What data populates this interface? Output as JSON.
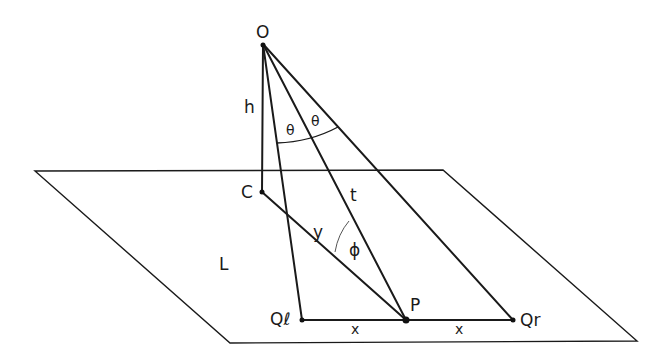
{
  "diagram": {
    "type": "geometry-3d-sketch",
    "plane_label": "L",
    "points": {
      "O": {
        "label": "O",
        "x": 263,
        "y": 44
      },
      "C": {
        "label": "C",
        "x": 262,
        "y": 192
      },
      "Ql": {
        "label": "Qℓ",
        "x": 302,
        "y": 320
      },
      "P": {
        "label": "P",
        "x": 406,
        "y": 320
      },
      "Qr": {
        "label": "Qr",
        "x": 513,
        "y": 320
      }
    },
    "segment_labels": {
      "h": "h",
      "t": "t",
      "y": "y",
      "x_left": "x",
      "x_right": "x"
    },
    "angle_labels": {
      "theta_left": "θ",
      "theta_right": "θ",
      "phi": "ϕ"
    },
    "plane_corners": [
      [
        35,
        171
      ],
      [
        443,
        170
      ],
      [
        637,
        341
      ],
      [
        230,
        343
      ]
    ]
  }
}
